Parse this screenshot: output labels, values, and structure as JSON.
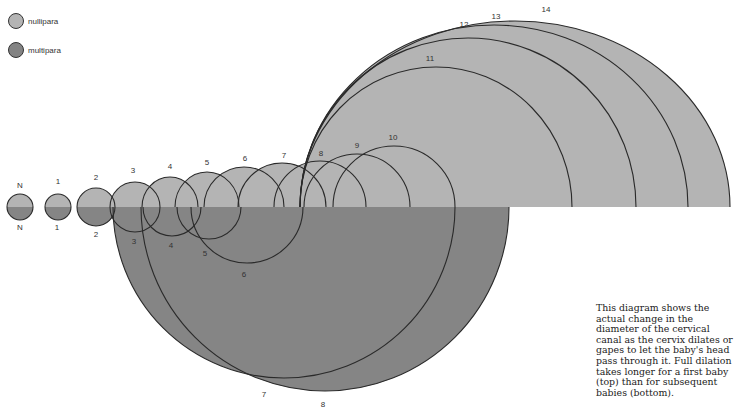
{
  "legend": {
    "items": [
      {
        "label": "nullipara",
        "color": "#b4b4b4"
      },
      {
        "label": "multipara",
        "color": "#838383"
      }
    ]
  },
  "caption": "This diagram shows the actual change in the diameter of the cervical canal as the cervix dilates or gapes to let the baby's head pass through it. Full dilation takes longer for a first baby (top) than for subsequent babies (bottom).",
  "colors": {
    "nullipara_fill": "#b4b4b4",
    "multipara_fill": "#858585",
    "outline": "#2a2a2a"
  },
  "baseline_y": 207,
  "nullipara_stages": [
    {
      "label": "N",
      "cx": 20,
      "rx": 13,
      "ry": 13,
      "lx": 20,
      "ly": 188
    },
    {
      "label": "1",
      "cx": 58,
      "rx": 13,
      "ry": 13,
      "lx": 58,
      "ly": 184
    },
    {
      "label": "2",
      "cx": 96,
      "rx": 19,
      "ry": 19,
      "lx": 96,
      "ly": 180
    },
    {
      "label": "3",
      "cx": 135,
      "rx": 25,
      "ry": 25,
      "lx": 133,
      "ly": 173
    },
    {
      "label": "4",
      "cx": 170,
      "rx": 28,
      "ry": 30,
      "lx": 170,
      "ly": 169
    },
    {
      "label": "5",
      "cx": 207,
      "rx": 32,
      "ry": 35,
      "lx": 207,
      "ly": 165
    },
    {
      "label": "6",
      "cx": 244,
      "rx": 40,
      "ry": 40,
      "lx": 245,
      "ly": 161
    },
    {
      "label": "7",
      "cx": 282,
      "rx": 44,
      "ry": 44,
      "lx": 284,
      "ly": 158
    },
    {
      "label": "8",
      "cx": 320,
      "rx": 46,
      "ry": 46,
      "lx": 321,
      "ly": 156
    },
    {
      "label": "9",
      "cx": 357,
      "rx": 53,
      "ry": 53,
      "lx": 357,
      "ly": 148
    },
    {
      "label": "10",
      "cx": 394,
      "rx": 61,
      "ry": 61,
      "lx": 393,
      "ly": 140
    },
    {
      "label": "11",
      "cx": 436,
      "rx": 136,
      "ry": 140,
      "lx": 430,
      "ly": 61
    },
    {
      "label": "12",
      "cx": 468,
      "rx": 168,
      "ry": 169,
      "lx": 464,
      "ly": 27
    },
    {
      "label": "13",
      "cx": 494,
      "rx": 194,
      "ry": 182,
      "lx": 496,
      "ly": 19
    },
    {
      "label": "14",
      "cx": 515,
      "rx": 215,
      "ry": 186,
      "lx": 546,
      "ly": 12
    }
  ],
  "multipara_stages": [
    {
      "label": "N",
      "cx": 20,
      "r": 13,
      "lx": 20,
      "ly": 230
    },
    {
      "label": "1",
      "cx": 58,
      "r": 13,
      "lx": 57,
      "ly": 230
    },
    {
      "label": "2",
      "cx": 96,
      "r": 19,
      "lx": 96,
      "ly": 237
    },
    {
      "label": "3",
      "cx": 135,
      "r": 25,
      "lx": 134,
      "ly": 244
    },
    {
      "label": "4",
      "cx": 172,
      "r": 29,
      "lx": 171,
      "ly": 248
    },
    {
      "label": "5",
      "cx": 209,
      "r": 32,
      "lx": 205,
      "ly": 256
    },
    {
      "label": "6",
      "cx": 247,
      "r": 56,
      "lx": 244,
      "ly": 277
    },
    {
      "label": "7",
      "cx": 284,
      "r": 171,
      "lx": 264,
      "ly": 397
    },
    {
      "label": "8",
      "cx": 325,
      "r": 184,
      "lx": 323,
      "ly": 407
    }
  ]
}
